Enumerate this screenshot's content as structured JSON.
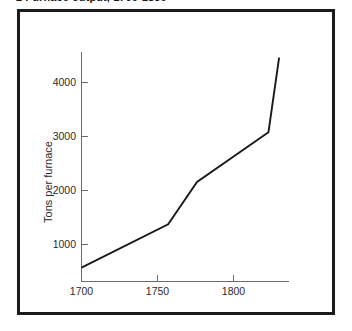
{
  "figure": {
    "caption": "2  Furnace output, 1700-1830"
  },
  "chart_data": {
    "type": "line",
    "title": "Furnace output, 1700-1830",
    "xlabel": "",
    "ylabel": "Tons per furnace",
    "xlim": [
      1690,
      1835
    ],
    "ylim": [
      0,
      4800
    ],
    "grid": false,
    "legend": false,
    "x_ticks": [
      1700,
      1750,
      1800
    ],
    "x_tick_labels": [
      "1700",
      "1750",
      "1800"
    ],
    "y_ticks": [
      1000,
      2000,
      3000,
      4000
    ],
    "y_tick_labels": [
      "1000",
      "2000",
      "3000",
      "4000"
    ],
    "series": [
      {
        "name": "Tons per furnace",
        "color": "#1a1a1a",
        "x": [
          1700,
          1757,
          1776,
          1823,
          1830
        ],
        "values": [
          280,
          1150,
          2000,
          3000,
          4500
        ]
      }
    ]
  },
  "axes": {
    "y_axis_title": "Tons per furnace"
  }
}
